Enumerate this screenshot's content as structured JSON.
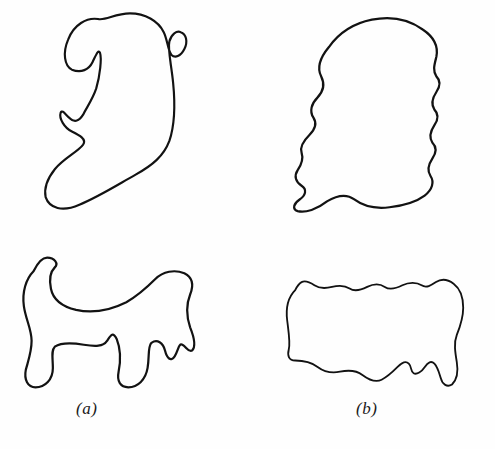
{
  "figure": {
    "kind": "line-drawing-figure",
    "background_color": "#fefefe",
    "stroke_color": "#121212",
    "stroke_width": 2.3,
    "width": 495,
    "height": 449
  },
  "panels": [
    {
      "id": "top-left",
      "name": "upper-left-contour",
      "label": "",
      "position": {
        "left": 40,
        "top": 2,
        "width": 150,
        "height": 215
      },
      "path": "M62,16 C50,14 36,22 30,38 C24,52 26,66 34,70 C44,74 52,70 56,62 C60,54 62,48 64,52 C66,58 64,76 60,90 C56,102 50,110 46,118 C41,126 36,126 32,122 C27,118 24,112 22,116 C20,122 26,132 34,136 C42,140 50,144 46,150 C40,158 26,164 16,176 C8,186 4,196 6,206 C10,218 24,222 42,214 C62,206 84,192 102,182 C120,172 132,162 138,146 C144,128 144,104 142,84 C140,64 136,48 138,40 C140,32 146,28 150,30 C156,32 158,40 154,48 C150,56 144,58 140,54 C136,48 136,38 132,30 C126,18 112,10 96,10 C80,10 70,18 62,16 Z"
    },
    {
      "id": "top-right",
      "name": "upper-right-contour",
      "label": "",
      "position": {
        "left": 288,
        "top": 8,
        "width": 160,
        "height": 210
      },
      "path": "M40,40 C30,52 28,62 32,70 C36,78 34,86 28,92 C22,98 20,106 24,112 C28,118 26,124 20,130 C14,136 10,142 12,148 C14,154 12,160 8,166 C4,172 6,178 12,182 C18,186 16,192 10,196 C4,200 2,206 8,208 C16,210 28,206 38,198 C48,192 58,190 66,196 C74,202 86,206 102,204 C118,202 130,198 138,192 C146,186 148,178 144,172 C140,166 142,160 146,154 C150,148 150,142 146,138 C142,132 144,126 148,120 C152,114 152,108 148,104 C144,98 146,92 150,86 C154,80 154,74 150,70 C146,64 148,58 150,50 C152,40 148,30 136,22 C122,12 104,8 84,12 C64,16 50,26 40,40 Z"
    },
    {
      "id": "bot-left",
      "name": "lower-left-contour",
      "label": "(a)",
      "position": {
        "left": 12,
        "top": 250,
        "width": 190,
        "height": 145
      },
      "path": "M22,22 C14,30 10,44 12,58 C14,72 20,82 20,94 C20,106 16,116 14,124 C12,134 16,142 24,142 C34,142 42,134 42,122 C42,112 40,104 44,100 C50,96 62,96 74,98 C86,100 94,100 98,94 C102,88 104,84 108,92 C112,102 112,116 110,126 C108,136 112,142 120,142 C130,142 138,134 140,122 C142,110 140,100 144,96 C150,92 156,96 158,104 C160,112 164,116 168,110 C172,104 172,96 176,98 C180,100 182,106 186,104 C190,100 188,90 184,80 C180,68 180,56 184,46 C188,36 186,28 178,24 C168,20 156,22 148,30 C140,38 132,46 118,54 C102,62 84,66 66,62 C50,58 42,50 40,40 C38,30 40,22 44,18 C48,14 44,8 36,8 C30,8 26,14 22,22 Z"
    },
    {
      "id": "bot-right",
      "name": "lower-right-contour",
      "label": "(b)",
      "position": {
        "left": 268,
        "top": 252,
        "width": 200,
        "height": 145
      },
      "path": "M34,40 C26,48 22,62 24,78 C26,94 28,106 26,114 C24,122 26,128 34,128 C44,128 54,130 62,136 C70,142 80,144 90,142 C100,140 110,140 118,146 C126,152 134,156 142,152 C150,148 156,142 162,136 C168,130 172,128 176,132 C180,136 178,142 182,144 C186,146 192,142 196,136 C200,130 204,128 208,132 C212,136 214,144 216,150 C218,158 224,162 230,158 C236,152 238,142 236,130 C234,118 232,106 236,96 C240,86 244,74 244,62 C244,48 240,38 232,32 C224,26 216,26 210,30 C204,34 198,38 192,34 C186,30 176,30 168,34 C160,38 152,40 146,36 C140,32 132,32 124,36 C116,40 108,42 102,38 C96,34 88,34 80,36 C72,38 64,38 58,34 C52,30 46,28 42,30 C38,32 36,36 34,40 Z"
    }
  ],
  "labels": [
    {
      "name": "panel-label-a",
      "text": "(a)",
      "x": 76,
      "y": 399
    },
    {
      "name": "panel-label-b",
      "text": "(b)",
      "x": 356,
      "y": 399
    }
  ]
}
